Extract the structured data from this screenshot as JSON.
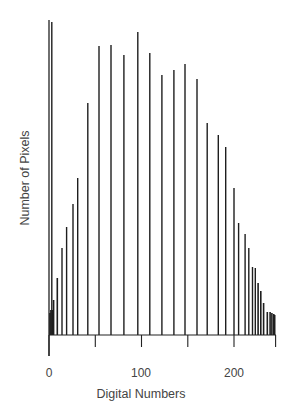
{
  "chart_data": {
    "type": "bar",
    "title": "",
    "xlabel": "Digital Numbers",
    "ylabel": "Number of Pixels",
    "xlim": [
      0,
      245
    ],
    "ylim": [
      0,
      320
    ],
    "grid": false,
    "legend": null,
    "x_ticks_major": [
      0,
      100,
      200
    ],
    "x_ticks_minor": [
      50,
      150,
      245
    ],
    "y_ticks": [],
    "note": "Y axis unlabeled; values are relative heights (approximate pixel-scale counts).",
    "x": [
      1,
      2,
      3,
      4,
      5,
      9,
      14,
      19,
      26,
      31,
      42,
      54,
      67,
      81,
      96,
      109,
      122,
      135,
      147,
      160,
      171,
      183,
      191,
      200,
      205,
      212,
      216,
      220,
      223,
      226,
      229,
      232,
      236,
      239,
      241,
      243,
      244
    ],
    "values": [
      22,
      25,
      313,
      25,
      35,
      57,
      87,
      108,
      131,
      157,
      232,
      289,
      290,
      280,
      303,
      282,
      260,
      265,
      271,
      256,
      212,
      200,
      188,
      147,
      112,
      101,
      87,
      68,
      67,
      52,
      44,
      32,
      23,
      23,
      22,
      21,
      20
    ]
  },
  "axes": {
    "xlabel": "Digital Numbers",
    "ylabel": "Number of Pixels",
    "tick_labels": [
      "0",
      "100",
      "200"
    ]
  }
}
